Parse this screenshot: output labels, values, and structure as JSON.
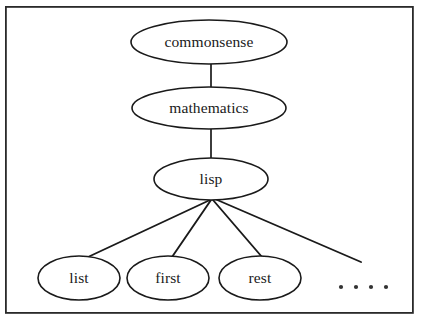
{
  "diagram": {
    "frame": {
      "x": 5,
      "y": 6,
      "width": 409,
      "height": 308,
      "stroke_color": "#2a2a2a"
    },
    "colors": {
      "node_fill": "#ffffff",
      "node_stroke": "#1a1a1a",
      "edge_stroke": "#1a1a1a",
      "text": "#1a1a1a",
      "background": "#ffffff"
    },
    "nodes": [
      {
        "id": "commonsense",
        "label": "commonsense",
        "cx": 209,
        "cy": 42,
        "rx": 78,
        "ry": 22,
        "level": 0
      },
      {
        "id": "mathematics",
        "label": "mathematics",
        "cx": 209,
        "cy": 108,
        "rx": 77,
        "ry": 21,
        "level": 1
      },
      {
        "id": "lisp",
        "label": "lisp",
        "cx": 211,
        "cy": 179,
        "rx": 57,
        "ry": 21,
        "level": 2
      },
      {
        "id": "list",
        "label": "list",
        "cx": 79,
        "cy": 278,
        "rx": 41,
        "ry": 22,
        "level": 3
      },
      {
        "id": "first",
        "label": "first",
        "cx": 168,
        "cy": 278,
        "rx": 41,
        "ry": 22,
        "level": 3
      },
      {
        "id": "rest",
        "label": "rest",
        "cx": 260,
        "cy": 278,
        "rx": 41,
        "ry": 22,
        "level": 3
      }
    ],
    "connectors": [
      {
        "id": "commonsense-mathematics",
        "from": "commonsense",
        "to": "mathematics",
        "x1": 211,
        "y1": 64,
        "x2": 211,
        "y2": 88
      },
      {
        "id": "mathematics-lisp",
        "from": "mathematics",
        "to": "lisp",
        "x1": 211,
        "y1": 129,
        "x2": 211,
        "y2": 158
      }
    ],
    "fan_edges": [
      {
        "id": "lisp-list",
        "from": "lisp",
        "to": "list",
        "x1": 210,
        "y1": 200,
        "x2": 88,
        "y2": 257
      },
      {
        "id": "lisp-first",
        "from": "lisp",
        "to": "first",
        "x1": 211,
        "y1": 200,
        "x2": 172,
        "y2": 257
      },
      {
        "id": "lisp-rest",
        "from": "lisp",
        "to": "rest",
        "x1": 213,
        "y1": 200,
        "x2": 262,
        "y2": 257
      },
      {
        "id": "lisp-more",
        "from": "lisp",
        "to": "ellipsis",
        "x1": 215,
        "y1": 199,
        "x2": 361,
        "y2": 262
      }
    ],
    "ellipsis": {
      "label": ". . . .",
      "count": 4,
      "cy": 287,
      "dots_x": [
        341,
        356,
        371,
        386
      ],
      "radius": 2.1
    }
  }
}
